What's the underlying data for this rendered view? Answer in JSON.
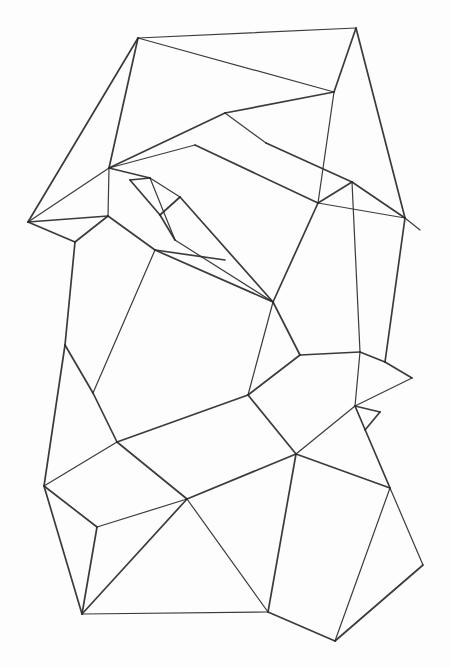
{
  "title": "Pencil sketch of a polygonal mesh",
  "stroke_color": "#2a2a2a",
  "background": "#fdfdfd",
  "vertices": {
    "A": [
      138,
      38
    ],
    "B": [
      356,
      28
    ],
    "C": [
      334,
      92
    ],
    "D": [
      225,
      113
    ],
    "E": [
      109,
      168
    ],
    "F": [
      28,
      222
    ],
    "G": [
      318,
      203
    ],
    "H": [
      266,
      143
    ],
    "I": [
      405,
      218
    ],
    "J": [
      352,
      182
    ],
    "K": [
      420,
      230
    ],
    "L": [
      75,
      242
    ],
    "M": [
      108,
      216
    ],
    "N": [
      155,
      250
    ],
    "O": [
      273,
      302
    ],
    "P": [
      248,
      395
    ],
    "Q": [
      300,
      355
    ],
    "R": [
      360,
      352
    ],
    "S": [
      385,
      362
    ],
    "T": [
      412,
      378
    ],
    "U": [
      355,
      406
    ],
    "V": [
      380,
      412
    ],
    "W": [
      365,
      430
    ],
    "X": [
      65,
      345
    ],
    "Y": [
      93,
      393
    ],
    "Z": [
      117,
      442
    ],
    "AA": [
      44,
      486
    ],
    "AB": [
      97,
      527
    ],
    "AC": [
      187,
      499
    ],
    "AD": [
      296,
      454
    ],
    "AE": [
      82,
      614
    ],
    "AF": [
      268,
      612
    ],
    "AG": [
      390,
      488
    ],
    "AH": [
      423,
      565
    ],
    "AI": [
      335,
      641
    ],
    "AJ": [
      195,
      145
    ],
    "AK": [
      225,
      260
    ],
    "AL": [
      150,
      178
    ],
    "AM": [
      180,
      197
    ],
    "AN": [
      160,
      215
    ],
    "AO": [
      175,
      240
    ],
    "AP": [
      130,
      180
    ]
  },
  "edges": [
    [
      "A",
      "B"
    ],
    [
      "A",
      "F"
    ],
    [
      "A",
      "E"
    ],
    [
      "A",
      "C"
    ],
    [
      "B",
      "C"
    ],
    [
      "B",
      "I"
    ],
    [
      "C",
      "G"
    ],
    [
      "C",
      "D"
    ],
    [
      "D",
      "E"
    ],
    [
      "E",
      "F"
    ],
    [
      "F",
      "L"
    ],
    [
      "E",
      "AL"
    ],
    [
      "E",
      "M"
    ],
    [
      "M",
      "F"
    ],
    [
      "M",
      "N"
    ],
    [
      "AL",
      "AM"
    ],
    [
      "AM",
      "AN"
    ],
    [
      "AN",
      "AO"
    ],
    [
      "AO",
      "AL"
    ],
    [
      "AL",
      "AP"
    ],
    [
      "AP",
      "AN"
    ],
    [
      "E",
      "AJ"
    ],
    [
      "AJ",
      "G"
    ],
    [
      "AM",
      "O"
    ],
    [
      "AO",
      "O"
    ],
    [
      "N",
      "O"
    ],
    [
      "N",
      "AK"
    ],
    [
      "G",
      "I"
    ],
    [
      "G",
      "J"
    ],
    [
      "J",
      "H"
    ],
    [
      "H",
      "D"
    ],
    [
      "G",
      "O"
    ],
    [
      "J",
      "I"
    ],
    [
      "I",
      "K"
    ],
    [
      "O",
      "Q"
    ],
    [
      "Q",
      "R"
    ],
    [
      "J",
      "R"
    ],
    [
      "R",
      "S"
    ],
    [
      "S",
      "T"
    ],
    [
      "T",
      "U"
    ],
    [
      "U",
      "V"
    ],
    [
      "V",
      "W"
    ],
    [
      "R",
      "U"
    ],
    [
      "Q",
      "P"
    ],
    [
      "P",
      "AD"
    ],
    [
      "O",
      "P"
    ],
    [
      "L",
      "X"
    ],
    [
      "X",
      "Y"
    ],
    [
      "N",
      "Y"
    ],
    [
      "Y",
      "Z"
    ],
    [
      "P",
      "Z"
    ],
    [
      "Z",
      "AA"
    ],
    [
      "AA",
      "X"
    ],
    [
      "AA",
      "AB"
    ],
    [
      "AB",
      "AC"
    ],
    [
      "Z",
      "AC"
    ],
    [
      "AC",
      "AD"
    ],
    [
      "AD",
      "U"
    ],
    [
      "AD",
      "AG"
    ],
    [
      "AG",
      "U"
    ],
    [
      "AG",
      "AH"
    ],
    [
      "AH",
      "AI"
    ],
    [
      "AI",
      "AF"
    ],
    [
      "AF",
      "AC"
    ],
    [
      "AF",
      "AD"
    ],
    [
      "AB",
      "AE"
    ],
    [
      "AE",
      "AF"
    ],
    [
      "AA",
      "AE"
    ],
    [
      "AE",
      "AC"
    ],
    [
      "AI",
      "AG"
    ],
    [
      "L",
      "M"
    ],
    [
      "I",
      "S"
    ]
  ]
}
